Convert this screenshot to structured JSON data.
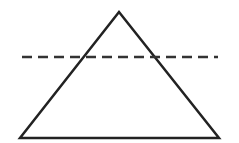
{
  "diagram": {
    "type": "geometry",
    "shapes": [
      {
        "kind": "triangle",
        "points": [
          [
            119,
            12
          ],
          [
            20,
            138
          ],
          [
            219,
            138
          ]
        ],
        "stroke": "#222222",
        "fill": "none"
      },
      {
        "kind": "dashed-line",
        "from": [
          22,
          57
        ],
        "to": [
          218,
          57
        ],
        "stroke": "#333333"
      }
    ],
    "labels": []
  }
}
